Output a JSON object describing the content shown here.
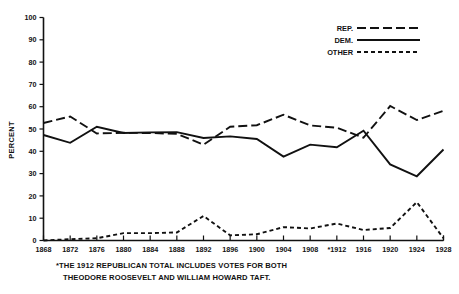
{
  "chart_data": {
    "type": "line",
    "title": "",
    "xlabel": "",
    "ylabel": "PERCENT",
    "ylim": [
      0,
      100
    ],
    "ytick_labels": [
      "0",
      "10",
      "20",
      "30",
      "40",
      "50",
      "60",
      "70",
      "80",
      "90",
      "100"
    ],
    "ytick_values": [
      0,
      10,
      20,
      30,
      40,
      50,
      60,
      70,
      80,
      90,
      100
    ],
    "grid": false,
    "legend_position": "top-right",
    "categories": [
      "1868",
      "1872",
      "1876",
      "1880",
      "1884",
      "1888",
      "1892",
      "1896",
      "1900",
      "1904",
      "1908",
      "*1912",
      "1916",
      "1920",
      "1924",
      "1928"
    ],
    "x_values": [
      1868,
      1872,
      1876,
      1880,
      1884,
      1888,
      1892,
      1896,
      1900,
      1904,
      1908,
      1912,
      1916,
      1920,
      1924,
      1928
    ],
    "series": [
      {
        "name": "REP.",
        "style": "long-dash",
        "values": [
          52.7,
          55.6,
          48.0,
          48.3,
          48.2,
          47.8,
          43.0,
          51.0,
          51.7,
          56.4,
          51.6,
          50.6,
          46.1,
          60.3,
          54.0,
          58.2
        ]
      },
      {
        "name": "DEM.",
        "style": "solid",
        "values": [
          47.3,
          43.8,
          51.0,
          48.2,
          48.5,
          48.6,
          46.0,
          46.7,
          45.5,
          37.6,
          43.0,
          41.8,
          49.2,
          34.1,
          28.8,
          40.8
        ]
      },
      {
        "name": "OTHER",
        "style": "short-dash",
        "values": [
          0.0,
          0.6,
          1.0,
          3.3,
          3.3,
          3.6,
          11.0,
          2.3,
          2.8,
          6.0,
          5.4,
          7.6,
          4.7,
          5.6,
          17.2,
          1.0
        ]
      }
    ],
    "legend": [
      {
        "label": "REP.",
        "style": "long-dash"
      },
      {
        "label": "DEM.",
        "style": "solid"
      },
      {
        "label": "OTHER",
        "style": "short-dash"
      }
    ],
    "footnote_lines": [
      "*THE 1912 REPUBLICAN TOTAL INCLUDES VOTES FOR BOTH",
      "THEODORE ROOSEVELT AND WILLIAM HOWARD TAFT."
    ],
    "colors": {
      "ink": "#111111",
      "background": "#ffffff"
    }
  }
}
